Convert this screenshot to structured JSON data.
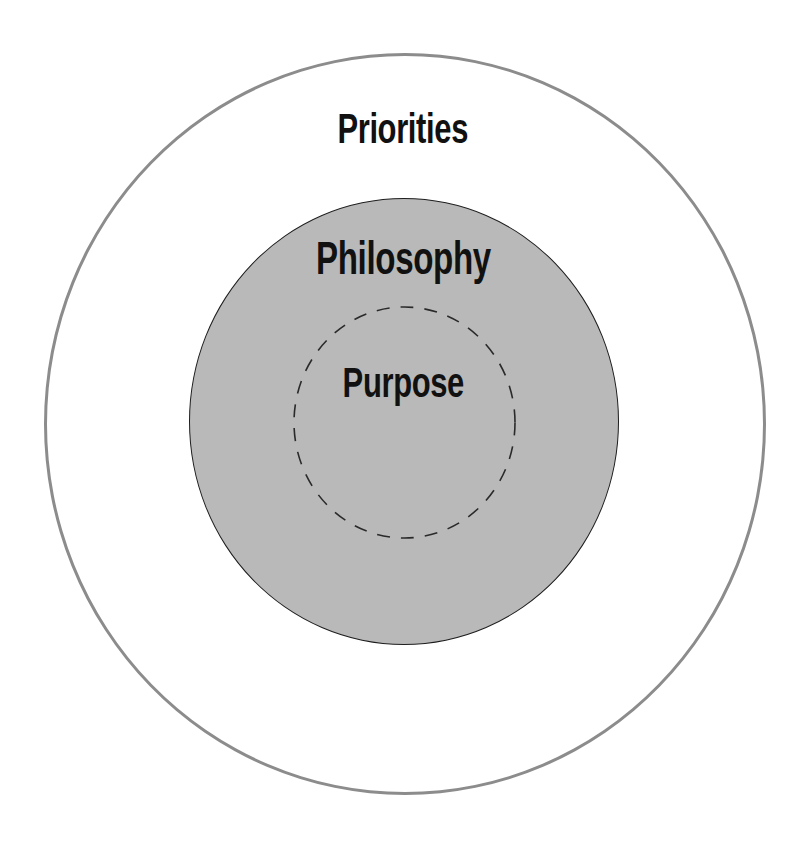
{
  "diagram": {
    "type": "nested-circles",
    "layers": [
      {
        "id": "outer",
        "label": "Priorities",
        "fill": "#ffffff",
        "stroke": "#8c8c8c",
        "stroke_style": "solid"
      },
      {
        "id": "middle",
        "label": "Philosophy",
        "fill": "#b9b9b9",
        "stroke": "#1e1e1e",
        "stroke_style": "solid"
      },
      {
        "id": "inner",
        "label": "Purpose",
        "fill": "none",
        "stroke": "#2a2a2a",
        "stroke_style": "dashed"
      }
    ]
  },
  "colors": {
    "background": "#ffffff",
    "text": "#111111"
  }
}
